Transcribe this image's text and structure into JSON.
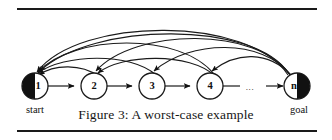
{
  "figure": {
    "caption": "Figure 3: A worst-case example",
    "ellipsis": "...",
    "colors": {
      "stroke": "#1a1a1a",
      "fill": "#ffffff",
      "marker": "#111111",
      "rule": "#1a1a1a"
    },
    "rules": {
      "top_y": 8,
      "bottom_y": 130
    },
    "nodes": [
      {
        "id": "n1",
        "label": "1",
        "cx": 35,
        "cy": 86,
        "r": 13,
        "half_disc": "left",
        "sublabel": "start"
      },
      {
        "id": "n2",
        "label": "2",
        "cx": 94,
        "cy": 86,
        "r": 13,
        "half_disc": "none",
        "sublabel": ""
      },
      {
        "id": "n3",
        "label": "3",
        "cx": 152,
        "cy": 86,
        "r": 13,
        "half_disc": "none",
        "sublabel": ""
      },
      {
        "id": "n4",
        "label": "4",
        "cx": 210,
        "cy": 86,
        "r": 13,
        "half_disc": "none",
        "sublabel": ""
      },
      {
        "id": "nn",
        "label": "n",
        "cx": 297,
        "cy": 86,
        "r": 13,
        "half_disc": "right",
        "sublabel": "goal"
      }
    ],
    "forward_edges": [
      {
        "from": "n1",
        "to": "n2",
        "arrow": true
      },
      {
        "from": "n2",
        "to": "n3",
        "arrow": true
      },
      {
        "from": "n3",
        "to": "n4",
        "arrow": true
      },
      {
        "from": "n4",
        "to": "ellipsis",
        "arrow": false
      },
      {
        "from": "ellipsis",
        "to": "nn",
        "arrow": true
      }
    ],
    "back_arcs": [
      {
        "from": "nn",
        "to": "n1",
        "apex_y": 16
      },
      {
        "from": "nn",
        "to": "n2",
        "apex_y": 26
      },
      {
        "from": "nn",
        "to": "n3",
        "apex_y": 38
      },
      {
        "from": "nn",
        "to": "n4",
        "apex_y": 50
      },
      {
        "from": "n4",
        "to": "n1",
        "apex_y": 32
      },
      {
        "from": "n4",
        "to": "n2",
        "apex_y": 52
      },
      {
        "from": "n3",
        "to": "n1",
        "apex_y": 52
      },
      {
        "from": "n2",
        "to": "n1",
        "apex_y": 64
      }
    ],
    "ellipsis_x": 250,
    "ellipsis_y": 88
  }
}
